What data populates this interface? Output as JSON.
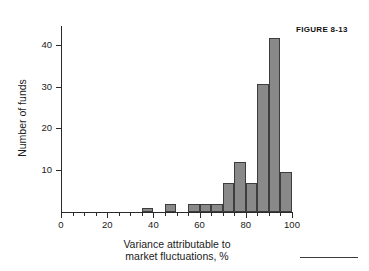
{
  "figure": {
    "caption": "FIGURE 8-13"
  },
  "chart_data": {
    "type": "bar",
    "title": "",
    "subtitle": "",
    "xlabel_line1": "Variance attributable to",
    "xlabel_line2": "market fluctuations, %",
    "ylabel": "Number of funds",
    "xlim": [
      0,
      100
    ],
    "ylim": [
      0,
      44
    ],
    "grid": false,
    "legend": false,
    "bin_width": 5,
    "bar_color": "#898989",
    "bar_edge_color": "#3d3d3d",
    "axis_color": "#2a2a2a",
    "x_tick_labels": [
      "0",
      "20",
      "40",
      "60",
      "80",
      "100"
    ],
    "x_tick_values": [
      0,
      20,
      40,
      60,
      80,
      100
    ],
    "x_minor_tick_values": [
      5,
      10,
      15,
      25,
      30,
      35,
      45,
      50,
      55,
      65,
      70,
      75,
      85,
      90,
      95
    ],
    "y_tick_labels": [
      "10",
      "20",
      "30",
      "40"
    ],
    "y_tick_values": [
      10,
      20,
      30,
      40
    ],
    "bins": [
      {
        "bin_start": 35,
        "bin_end": 40,
        "value": 1
      },
      {
        "bin_start": 45,
        "bin_end": 50,
        "value": 2
      },
      {
        "bin_start": 55,
        "bin_end": 60,
        "value": 2
      },
      {
        "bin_start": 60,
        "bin_end": 65,
        "value": 2
      },
      {
        "bin_start": 65,
        "bin_end": 70,
        "value": 2
      },
      {
        "bin_start": 70,
        "bin_end": 75,
        "value": 7
      },
      {
        "bin_start": 75,
        "bin_end": 80,
        "value": 12
      },
      {
        "bin_start": 80,
        "bin_end": 85,
        "value": 7
      },
      {
        "bin_start": 85,
        "bin_end": 90,
        "value": 30.5
      },
      {
        "bin_start": 90,
        "bin_end": 95,
        "value": 41.5
      },
      {
        "bin_start": 95,
        "bin_end": 100,
        "value": 9.5
      }
    ]
  }
}
